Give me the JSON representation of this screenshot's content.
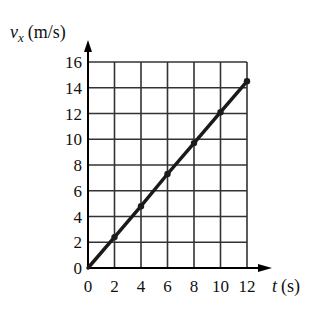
{
  "chart_data": {
    "type": "line",
    "title": "",
    "xlabel": "t (s)",
    "ylabel": "v_x (m/s)",
    "xlabel_parts": {
      "var": "t",
      "unit": "(s)"
    },
    "ylabel_parts": {
      "var": "v",
      "sub": "x",
      "unit": "(m/s)"
    },
    "xlim": [
      0,
      12
    ],
    "ylim": [
      0,
      16
    ],
    "x_ticks": [
      0,
      2,
      4,
      6,
      8,
      10,
      12
    ],
    "y_ticks": [
      0,
      2,
      4,
      6,
      8,
      10,
      12,
      14,
      16
    ],
    "grid": true,
    "legend": null,
    "series": [
      {
        "name": "v_x",
        "x": [
          0,
          2,
          4,
          6,
          8,
          10,
          12
        ],
        "y": [
          0,
          2.4,
          4.8,
          7.3,
          9.7,
          12.1,
          14.5
        ],
        "markers": [
          2,
          4,
          6,
          8,
          10,
          12
        ]
      }
    ],
    "colors": {
      "line": "#1a1a1a",
      "grid": "#333333",
      "axis": "#000000"
    }
  }
}
